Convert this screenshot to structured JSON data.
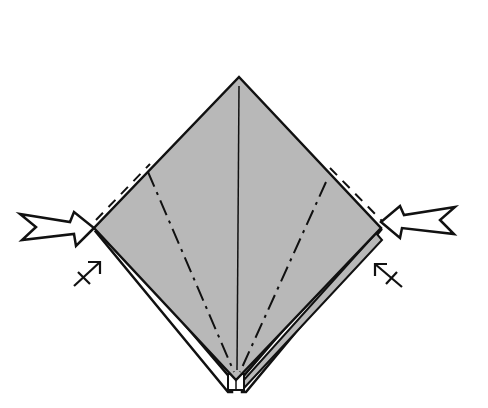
{
  "diagram": {
    "type": "origami-fold-step",
    "colors": {
      "paper_fill": "#b8b8b8",
      "line": "#111111",
      "background": "#ffffff",
      "arrow_fill": "#ffffff"
    },
    "elements": {
      "left_push_arrow": "push-in arrow pointing right toward left corner",
      "right_push_arrow": "push-in arrow pointing left toward right corner",
      "left_small_arrow": "small fold arrow with crossbar (left)",
      "right_small_arrow": "small fold arrow with crossbar (right)",
      "center_crease": "vertical center crease",
      "mountain_folds": "two dash-dot mountain fold lines converging at bottom",
      "valley_edges": "dashed valley fold lines along upper edges"
    }
  }
}
